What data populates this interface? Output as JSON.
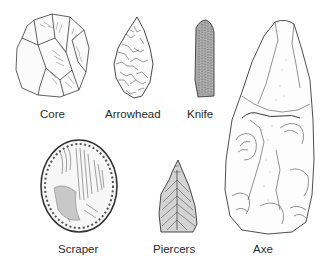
{
  "diagram": {
    "type": "illustration",
    "colors": {
      "background": "#ffffff",
      "ink": "#333333",
      "label": "#2a2a2a"
    },
    "tools": [
      {
        "id": "core",
        "label": "Core",
        "icon": "core-stone-icon"
      },
      {
        "id": "arrowhead",
        "label": "Arrowhead",
        "icon": "arrowhead-icon"
      },
      {
        "id": "knife",
        "label": "Knife",
        "icon": "knife-blade-icon"
      },
      {
        "id": "axe",
        "label": "Axe",
        "icon": "hand-axe-icon"
      },
      {
        "id": "scraper",
        "label": "Scraper",
        "icon": "scraper-icon"
      },
      {
        "id": "piercers",
        "label": "Piercers",
        "icon": "piercer-icon"
      }
    ]
  }
}
